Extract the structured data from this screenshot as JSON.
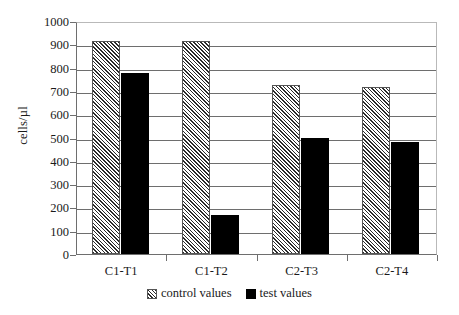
{
  "chart_data": {
    "type": "bar",
    "title": "",
    "xlabel": "",
    "ylabel": "cells/µl",
    "categories": [
      "C1-T1",
      "C1-T2",
      "C2-T3",
      "C2-T4"
    ],
    "series": [
      {
        "name": "control values",
        "values": [
          915,
          915,
          725,
          715
        ]
      },
      {
        "name": "test values",
        "values": [
          775,
          167,
          498,
          480
        ]
      }
    ],
    "ylim": [
      0,
      1000
    ],
    "ytick_labels": [
      "0",
      "100",
      "200",
      "300",
      "400",
      "500",
      "600",
      "700",
      "800",
      "900",
      "1000"
    ],
    "ytick_values": [
      0,
      100,
      200,
      300,
      400,
      500,
      600,
      700,
      800,
      900,
      1000
    ],
    "grid": true,
    "legend_position": "bottom",
    "colors": {
      "control_fill": "#e8e8e8",
      "control_hatch": "#2b2b2b",
      "test_fill": "#000000",
      "axis": "#6e6e6e",
      "frame": "#b9b9b9",
      "background": "#ffffff"
    }
  },
  "legend": {
    "entries": [
      {
        "label": "control values",
        "swatch": "hatched-swatch-icon"
      },
      {
        "label": "test values",
        "swatch": "solid-black-swatch-icon"
      }
    ]
  }
}
